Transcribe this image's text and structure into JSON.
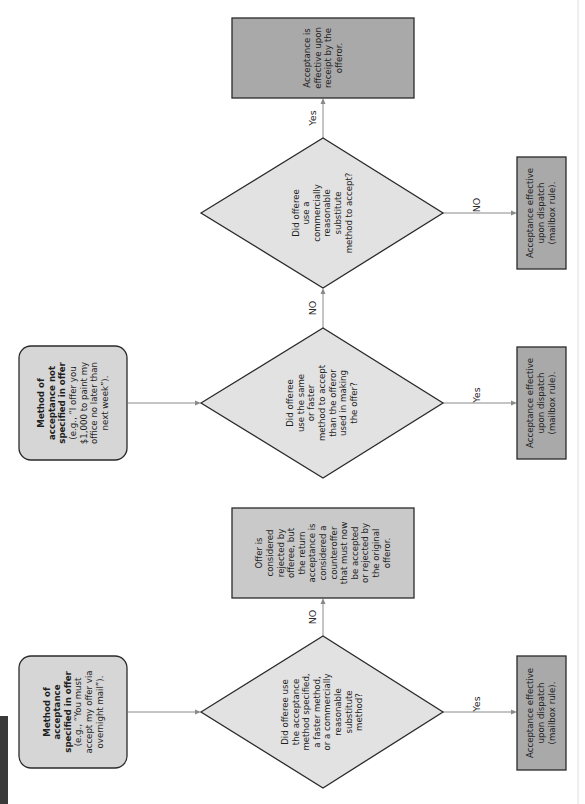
{
  "diagram": {
    "title": "",
    "orientation": "rotated-90-counterclockwise",
    "start_nodes": [
      {
        "id": "specified",
        "bold_lines": [
          "Method of",
          "acceptance",
          "specified in offer"
        ],
        "lines": [
          "(e.g., “You must",
          "accept my offer via",
          "overnight mail”)."
        ]
      },
      {
        "id": "not-specified",
        "bold_lines": [
          "Method of",
          "acceptance not",
          "specified in offer"
        ],
        "lines": [
          "(e.g., “I offer you",
          "$1,000 to paint my",
          "office no later than",
          "next week”)."
        ]
      }
    ],
    "decisions": [
      {
        "id": "d1",
        "lines": [
          "Did offeree use",
          "the acceptance",
          "method specified,",
          "a faster method,",
          "or a commercially",
          "reasonable",
          "substitute",
          "method?"
        ]
      },
      {
        "id": "d2",
        "lines": [
          "Did offeree",
          "use the same",
          "or faster",
          "method to accept",
          "than the offeror",
          "used in making",
          "the offer?"
        ]
      },
      {
        "id": "d3",
        "lines": [
          "Did offeree",
          "use a",
          "commercially",
          "reasonable",
          "substitute",
          "method to accept?"
        ]
      }
    ],
    "outcomes": [
      {
        "id": "rejected",
        "lines": [
          "Offer is",
          "considered",
          "rejected by",
          "offeree, but",
          "the return",
          "acceptance is",
          "considered a",
          "counteroffer",
          "that must now",
          "be accepted",
          "or rejected by",
          "the original",
          "offeror."
        ]
      },
      {
        "id": "receipt",
        "lines": [
          "Acceptance is",
          "effective upon",
          "receipt by the",
          "offeror."
        ]
      },
      {
        "id": "dispatch-1",
        "lines": [
          "Acceptance effective",
          "upon dispatch",
          "(mailbox rule)."
        ]
      },
      {
        "id": "dispatch-2",
        "lines": [
          "Acceptance effective",
          "upon dispatch",
          "(mailbox rule)."
        ]
      },
      {
        "id": "dispatch-3",
        "lines": [
          "Acceptance effective",
          "upon dispatch",
          "(mailbox rule)."
        ]
      }
    ],
    "edges": [
      {
        "from": "specified",
        "to": "d1",
        "label": ""
      },
      {
        "from": "d1",
        "to": "rejected",
        "label": "NO"
      },
      {
        "from": "d1",
        "to": "dispatch-1",
        "label": "Yes"
      },
      {
        "from": "not-specified",
        "to": "d2",
        "label": ""
      },
      {
        "from": "d2",
        "to": "d3",
        "label": "NO"
      },
      {
        "from": "d2",
        "to": "dispatch-2",
        "label": "Yes"
      },
      {
        "from": "d3",
        "to": "receipt",
        "label": "NO"
      },
      {
        "from": "d3",
        "to": "dispatch-3",
        "label": "Yes"
      }
    ]
  }
}
